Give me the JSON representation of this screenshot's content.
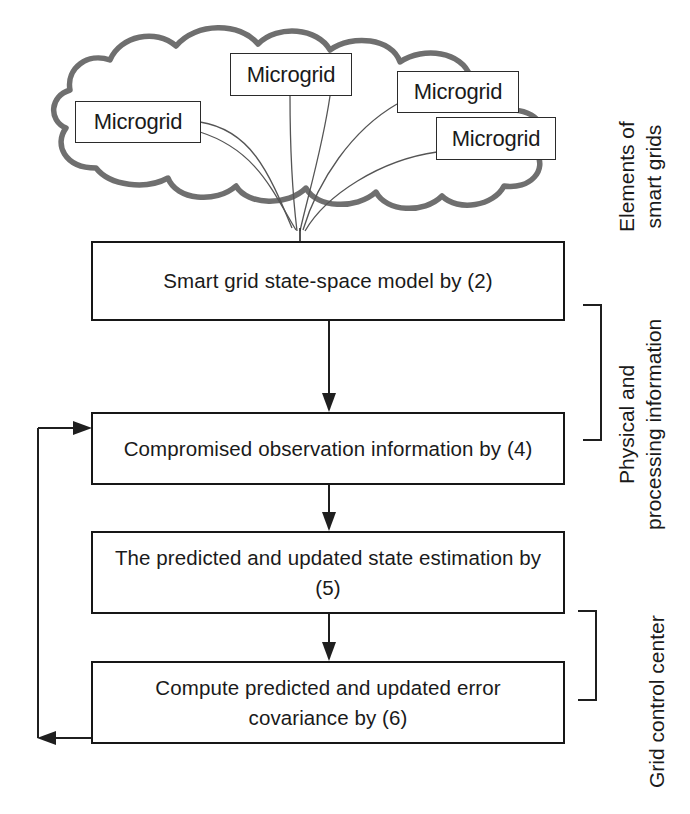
{
  "diagram": {
    "cloud": {
      "name": "smart-grid-cloud",
      "nodes": [
        {
          "label": "Microgrid"
        },
        {
          "label": "Microgrid"
        },
        {
          "label": "Microgrid"
        },
        {
          "label": "Microgrid"
        }
      ]
    },
    "process_steps": [
      {
        "id": "step-2",
        "label": "Smart grid state-space model by (2)",
        "equation_ref": "(2)"
      },
      {
        "id": "step-4",
        "label": "Compromised observation information by (4)",
        "equation_ref": "(4)"
      },
      {
        "id": "step-5",
        "label": "The predicted and updated state estimation by (5)",
        "equation_ref": "(5)"
      },
      {
        "id": "step-6",
        "label": "Compute predicted and updated error covariance by (6)",
        "equation_ref": "(6)"
      }
    ],
    "group_labels": [
      {
        "id": "group-elements",
        "line1": "Elements of",
        "line2": "smart grids"
      },
      {
        "id": "group-physical",
        "line1": "Physical and",
        "line2": "processing information"
      },
      {
        "id": "group-control",
        "line1": "Grid control center",
        "line2": ""
      }
    ],
    "colors": {
      "cloud_outline": "#6f6f6f",
      "box_outline": "#171717",
      "connector": "#3a3a3a",
      "text": "#1a1a1a",
      "background": "#ffffff"
    }
  }
}
